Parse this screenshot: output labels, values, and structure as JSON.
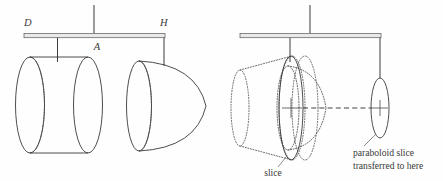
{
  "figure": {
    "background_color": "#fefefe",
    "ink_color": "#3a3a3a"
  },
  "left_diagram": {
    "name": "balance-with-cylinder-and-paraboloid",
    "labels": {
      "left_end": "D",
      "fulcrum": "A",
      "right_end": "H"
    },
    "solids": [
      {
        "name": "cylinder",
        "style": "solid-outline-with-dotted-hidden-edge"
      },
      {
        "name": "paraboloid",
        "style": "solid-outline-with-dotted-hidden-edge"
      }
    ]
  },
  "right_diagram": {
    "name": "balance-with-slice-transfer",
    "solids": [
      {
        "name": "cone-ghost",
        "style": "dotted"
      },
      {
        "name": "paraboloid-ghost",
        "style": "dotted"
      },
      {
        "name": "cylinder-ghost",
        "style": "dotted"
      }
    ],
    "captions": {
      "slice": "slice",
      "transferred_line1": "paraboloid slice",
      "transferred_line2": "transferred to here"
    },
    "annotations": {
      "transfer_arrow": "dashed-horizontal-arrow"
    }
  }
}
